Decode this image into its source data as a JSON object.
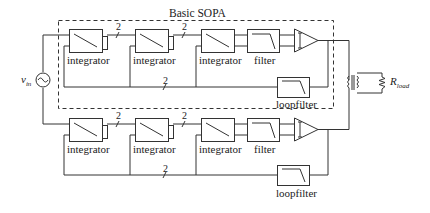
{
  "diagram": {
    "title": "Basic SOPA",
    "source_label": "v",
    "source_subscript": "in",
    "load_label": "R",
    "load_subscript": "load",
    "bus_width": "2",
    "top_chain": {
      "blocks": [
        "integrator",
        "integrator",
        "integrator",
        "filter"
      ],
      "loopfilter": "loopfilter"
    },
    "bottom_chain": {
      "blocks": [
        "integrator",
        "integrator",
        "integrator",
        "filter"
      ],
      "loopfilter": "loopfilter"
    },
    "colors": {
      "line": "#333333",
      "background": "#ffffff"
    }
  }
}
